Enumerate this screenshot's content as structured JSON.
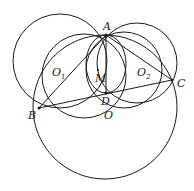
{
  "diagram": {
    "type": "geometry",
    "points": {
      "A": {
        "label": "A",
        "x": 106,
        "y": 35
      },
      "B": {
        "label": "B",
        "x": 39,
        "y": 108
      },
      "C": {
        "label": "C",
        "x": 172,
        "y": 80
      },
      "D": {
        "label": "D",
        "x": 106,
        "y": 93
      },
      "O": {
        "label": "O",
        "x": 106,
        "y": 106
      },
      "M": {
        "label": "M",
        "x": 97,
        "y": 73
      },
      "O1": {
        "label": "O",
        "sub": "1",
        "x": 62,
        "y": 72
      },
      "O2": {
        "label": "O",
        "sub": "2",
        "x": 140,
        "y": 72
      }
    },
    "stroke_color": "#1a1a1a"
  }
}
